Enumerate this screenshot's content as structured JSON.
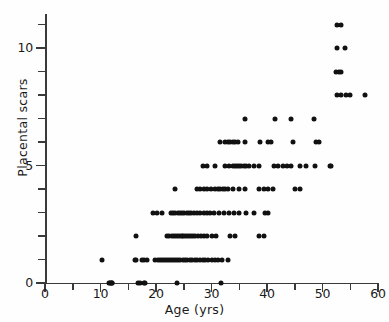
{
  "chart_data": {
    "type": "scatter",
    "title": "",
    "xlabel": "Age (yrs)",
    "ylabel": "Placental scars",
    "xlim": [
      0,
      60
    ],
    "ylim": [
      0,
      11.6
    ],
    "xticks": [
      0,
      10,
      20,
      30,
      40,
      50,
      60
    ],
    "xtick_labels": [
      "0",
      "10",
      "20",
      "30",
      "40",
      "50",
      "60"
    ],
    "xminor_step": 5,
    "yticks": [
      0,
      1,
      2,
      3,
      4,
      5,
      6,
      7,
      8,
      9,
      10,
      11
    ],
    "ytick_labels": [
      "0",
      "",
      "",
      "",
      "",
      "5",
      "",
      "",
      "",
      "",
      "10",
      ""
    ],
    "grid": false,
    "legend": null,
    "marker": "filled-circle",
    "marker_color": "#111111",
    "points": [
      [
        11.6,
        0
      ],
      [
        11.8,
        0
      ],
      [
        11.9,
        0
      ],
      [
        12.0,
        0
      ],
      [
        12.1,
        0
      ],
      [
        16.8,
        0
      ],
      [
        17.2,
        0
      ],
      [
        17.8,
        0
      ],
      [
        18.0,
        0
      ],
      [
        23.8,
        0
      ],
      [
        31.8,
        0
      ],
      [
        10.2,
        1
      ],
      [
        16.2,
        1
      ],
      [
        16.4,
        1
      ],
      [
        17.5,
        1
      ],
      [
        17.9,
        1
      ],
      [
        18.3,
        1
      ],
      [
        19.9,
        1
      ],
      [
        20.4,
        1
      ],
      [
        20.8,
        1
      ],
      [
        21.1,
        1
      ],
      [
        21.4,
        1
      ],
      [
        21.8,
        1
      ],
      [
        22.2,
        1
      ],
      [
        22.5,
        1
      ],
      [
        22.9,
        1
      ],
      [
        23.3,
        1
      ],
      [
        23.6,
        1
      ],
      [
        24.0,
        1
      ],
      [
        24.4,
        1
      ],
      [
        24.8,
        1
      ],
      [
        25.2,
        1
      ],
      [
        25.6,
        1
      ],
      [
        26.1,
        1
      ],
      [
        26.5,
        1
      ],
      [
        27.0,
        1
      ],
      [
        27.4,
        1
      ],
      [
        27.9,
        1
      ],
      [
        28.4,
        1
      ],
      [
        28.9,
        1
      ],
      [
        29.4,
        1
      ],
      [
        30.0,
        1
      ],
      [
        30.6,
        1
      ],
      [
        31.2,
        1
      ],
      [
        31.9,
        1
      ],
      [
        33.0,
        1
      ],
      [
        16.4,
        2
      ],
      [
        22.0,
        2
      ],
      [
        22.4,
        2
      ],
      [
        22.8,
        2
      ],
      [
        23.2,
        2
      ],
      [
        23.6,
        2
      ],
      [
        24.0,
        2
      ],
      [
        24.3,
        2
      ],
      [
        24.6,
        2
      ],
      [
        24.9,
        2
      ],
      [
        25.2,
        2
      ],
      [
        25.5,
        2
      ],
      [
        25.9,
        2
      ],
      [
        26.3,
        2
      ],
      [
        26.7,
        2
      ],
      [
        27.1,
        2
      ],
      [
        27.6,
        2
      ],
      [
        28.1,
        2
      ],
      [
        28.6,
        2
      ],
      [
        29.2,
        2
      ],
      [
        30.0,
        2
      ],
      [
        30.8,
        2
      ],
      [
        33.4,
        2
      ],
      [
        34.2,
        2
      ],
      [
        38.6,
        2
      ],
      [
        39.4,
        2
      ],
      [
        19.4,
        3
      ],
      [
        20.2,
        3
      ],
      [
        21.0,
        3
      ],
      [
        22.7,
        3
      ],
      [
        23.1,
        3
      ],
      [
        23.5,
        3
      ],
      [
        23.9,
        3
      ],
      [
        24.3,
        3
      ],
      [
        24.7,
        3
      ],
      [
        25.1,
        3
      ],
      [
        25.5,
        3
      ],
      [
        25.9,
        3
      ],
      [
        26.3,
        3
      ],
      [
        26.8,
        3
      ],
      [
        27.4,
        3
      ],
      [
        28.0,
        3
      ],
      [
        28.6,
        3
      ],
      [
        29.2,
        3
      ],
      [
        29.8,
        3
      ],
      [
        30.5,
        3
      ],
      [
        31.3,
        3
      ],
      [
        32.2,
        3
      ],
      [
        33.1,
        3
      ],
      [
        34.0,
        3
      ],
      [
        35.0,
        3
      ],
      [
        36.2,
        3
      ],
      [
        37.6,
        3
      ],
      [
        39.6,
        3
      ],
      [
        40.2,
        3
      ],
      [
        23.4,
        4
      ],
      [
        27.4,
        4
      ],
      [
        28.0,
        4
      ],
      [
        28.6,
        4
      ],
      [
        29.2,
        4
      ],
      [
        29.9,
        4
      ],
      [
        30.6,
        4
      ],
      [
        31.2,
        4
      ],
      [
        31.6,
        4
      ],
      [
        32.0,
        4
      ],
      [
        32.4,
        4
      ],
      [
        33.0,
        4
      ],
      [
        33.8,
        4
      ],
      [
        35.0,
        4
      ],
      [
        36.0,
        4
      ],
      [
        38.6,
        4
      ],
      [
        39.4,
        4
      ],
      [
        40.2,
        4
      ],
      [
        41.0,
        4
      ],
      [
        45.0,
        4
      ],
      [
        46.0,
        4
      ],
      [
        28.4,
        5
      ],
      [
        29.2,
        5
      ],
      [
        30.6,
        5
      ],
      [
        32.4,
        5
      ],
      [
        33.2,
        5
      ],
      [
        33.8,
        5
      ],
      [
        34.2,
        5
      ],
      [
        34.6,
        5
      ],
      [
        35.0,
        5
      ],
      [
        35.4,
        5
      ],
      [
        35.8,
        5
      ],
      [
        36.2,
        5
      ],
      [
        36.8,
        5
      ],
      [
        37.6,
        5
      ],
      [
        38.6,
        5
      ],
      [
        41.2,
        5
      ],
      [
        42.0,
        5
      ],
      [
        42.8,
        5
      ],
      [
        43.6,
        5
      ],
      [
        44.4,
        5
      ],
      [
        46.0,
        5
      ],
      [
        47.0,
        5
      ],
      [
        48.6,
        5
      ],
      [
        51.4,
        5
      ],
      [
        51.6,
        5
      ],
      [
        31.6,
        6
      ],
      [
        32.4,
        6
      ],
      [
        33.0,
        6
      ],
      [
        33.4,
        6
      ],
      [
        33.8,
        6
      ],
      [
        34.2,
        6
      ],
      [
        34.8,
        6
      ],
      [
        36.0,
        6
      ],
      [
        38.8,
        6
      ],
      [
        40.2,
        6
      ],
      [
        40.8,
        6
      ],
      [
        44.6,
        6
      ],
      [
        48.8,
        6
      ],
      [
        49.4,
        6
      ],
      [
        36.0,
        7
      ],
      [
        41.4,
        7
      ],
      [
        44.4,
        7
      ],
      [
        48.4,
        7
      ],
      [
        52.6,
        8
      ],
      [
        53.4,
        8
      ],
      [
        54.2,
        8
      ],
      [
        55.0,
        8
      ],
      [
        57.6,
        8
      ],
      [
        52.4,
        9
      ],
      [
        52.9,
        9
      ],
      [
        53.4,
        9
      ],
      [
        52.6,
        10
      ],
      [
        54.0,
        10
      ],
      [
        52.6,
        11
      ],
      [
        53.4,
        11
      ]
    ]
  }
}
